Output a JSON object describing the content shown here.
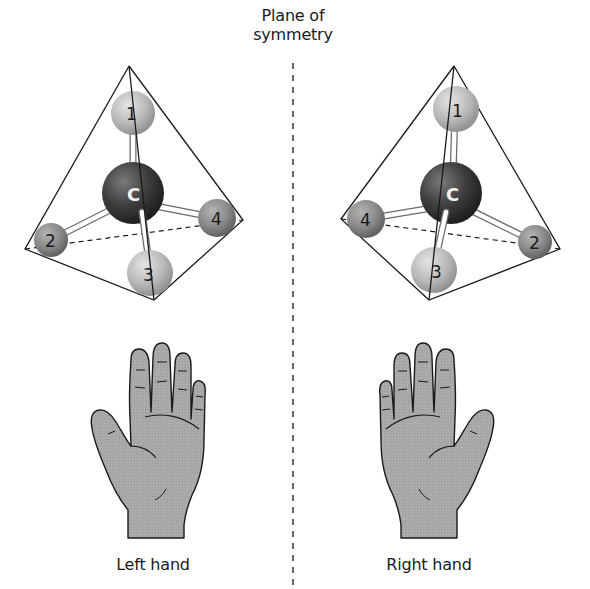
{
  "figure": {
    "title_line1": "Plane of",
    "title_line2": "symmetry",
    "left_caption": "Left hand",
    "right_caption": "Right hand"
  },
  "molecules": {
    "left": {
      "center_atom": "C",
      "substituents": [
        "1",
        "2",
        "3",
        "4"
      ]
    },
    "right": {
      "center_atom": "C",
      "substituents": [
        "1",
        "2",
        "3",
        "4"
      ]
    }
  },
  "colors": {
    "outline": "#1a1a1a",
    "carbon": "#3c3c3c",
    "light_atom": "#b8b8b8",
    "medium_atom": "#8a8a8a",
    "hand_fill": "#a9a9a9",
    "bond": "#ffffff"
  }
}
